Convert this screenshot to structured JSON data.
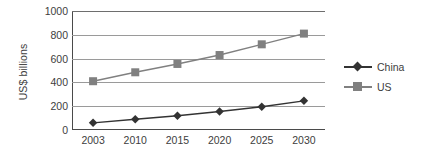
{
  "chart_data": {
    "type": "line",
    "title": "",
    "xlabel": "",
    "ylabel": "US$ billions",
    "categories": [
      "2003",
      "2010",
      "2015",
      "2020",
      "2025",
      "2030"
    ],
    "ylim": [
      0,
      1000
    ],
    "yticks": [
      0,
      200,
      400,
      600,
      800,
      1000
    ],
    "ytick_labels": [
      "0",
      "200",
      "400",
      "600",
      "800",
      "1000"
    ],
    "grid": "horizontal",
    "legend_position": "right",
    "series": [
      {
        "name": "China",
        "color": "#333333",
        "marker": "diamond",
        "values": [
          60,
          90,
          120,
          155,
          195,
          245
        ]
      },
      {
        "name": "US",
        "color": "#808080",
        "marker": "square",
        "values": [
          410,
          485,
          555,
          630,
          720,
          810
        ]
      }
    ]
  },
  "legend": {
    "items": [
      {
        "label": "China"
      },
      {
        "label": "US"
      }
    ]
  }
}
